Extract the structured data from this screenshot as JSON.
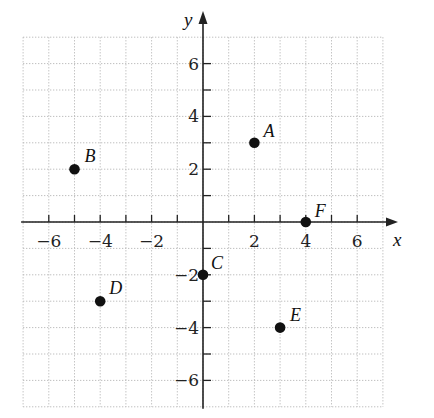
{
  "chart_data": {
    "type": "scatter",
    "title": "",
    "xlabel": "x",
    "ylabel": "y",
    "xlim": [
      -7,
      7
    ],
    "ylim": [
      -7,
      7
    ],
    "grid": true,
    "grid_style": "dotted",
    "x_ticks": [
      -6,
      -4,
      -2,
      2,
      4,
      6
    ],
    "y_ticks": [
      -6,
      -4,
      -2,
      2,
      4,
      6
    ],
    "x_tick_labels": [
      "−6",
      "−4",
      "−2",
      "2",
      "4",
      "6"
    ],
    "y_tick_labels": [
      "−6",
      "−4",
      "−2",
      "2",
      "4",
      "6"
    ],
    "points": [
      {
        "label": "A",
        "x": 2,
        "y": 3
      },
      {
        "label": "B",
        "x": -5,
        "y": 2
      },
      {
        "label": "C",
        "x": 0,
        "y": -2
      },
      {
        "label": "D",
        "x": -4,
        "y": -3
      },
      {
        "label": "E",
        "x": 3,
        "y": -4
      },
      {
        "label": "F",
        "x": 4,
        "y": 0
      }
    ],
    "legend": null
  },
  "colors": {
    "axis": "#222222",
    "grid": "#b8b8b8",
    "point": "#111111",
    "background": "#ffffff"
  }
}
